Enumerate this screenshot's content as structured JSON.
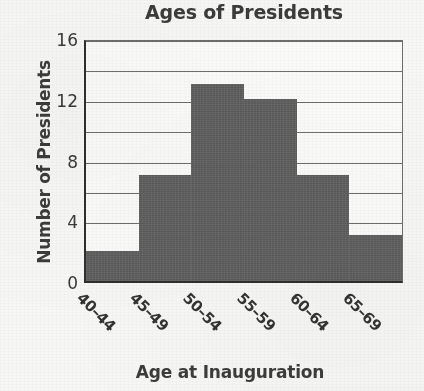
{
  "chart_data": {
    "type": "bar",
    "title": "Ages of Presidents",
    "xlabel": "Age at Inauguration",
    "ylabel": "Number of Presidents",
    "categories": [
      "40–44",
      "45–49",
      "50–54",
      "55–59",
      "60–64",
      "65–69"
    ],
    "values": [
      2,
      7,
      13,
      12,
      7,
      3
    ],
    "ylim": [
      0,
      16
    ],
    "y_ticks": [
      0,
      4,
      8,
      12,
      16
    ],
    "y_gridline_values": [
      2,
      4,
      6,
      8,
      10,
      12,
      14,
      16
    ],
    "grid": true,
    "legend": "none",
    "bar_gap": 0,
    "colors": {
      "bar": "#5e5e5e",
      "axis": "#2f2f2f",
      "gridline": "#6e6e6e",
      "text": "#3a3a3a",
      "background": "#f7f7f5",
      "plot_background": "#fbfbfa"
    }
  }
}
